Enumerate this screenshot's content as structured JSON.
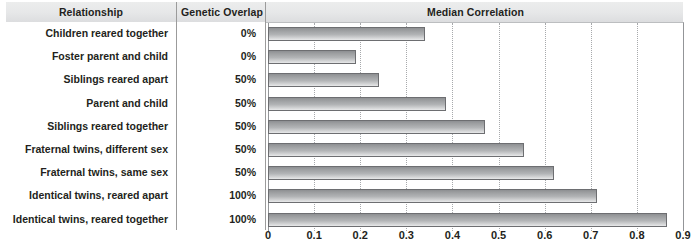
{
  "header": {
    "col_relationship": "Relationship",
    "col_genetic_overlap": "Genetic Overlap",
    "col_median_correlation": "Median Correlation"
  },
  "rows": [
    {
      "relationship": "Children reared together",
      "genetic_overlap": "0%",
      "median_correlation": 0.34
    },
    {
      "relationship": "Foster parent and child",
      "genetic_overlap": "0%",
      "median_correlation": 0.19
    },
    {
      "relationship": "Siblings reared apart",
      "genetic_overlap": "50%",
      "median_correlation": 0.24
    },
    {
      "relationship": "Parent and child",
      "genetic_overlap": "50%",
      "median_correlation": 0.385
    },
    {
      "relationship": "Siblings reared together",
      "genetic_overlap": "50%",
      "median_correlation": 0.47
    },
    {
      "relationship": "Fraternal twins, different sex",
      "genetic_overlap": "50%",
      "median_correlation": 0.555
    },
    {
      "relationship": "Fraternal twins, same sex",
      "genetic_overlap": "50%",
      "median_correlation": 0.62
    },
    {
      "relationship": "Identical twins, reared apart",
      "genetic_overlap": "100%",
      "median_correlation": 0.713
    },
    {
      "relationship": "Identical twins, reared together",
      "genetic_overlap": "100%",
      "median_correlation": 0.865
    }
  ],
  "axis": {
    "ticks": [
      "0",
      "0.1",
      "0.2",
      "0.3",
      "0.4",
      "0.5",
      "0.6",
      "0.7",
      "0.8",
      "0.9"
    ],
    "min": 0,
    "max": 0.9
  },
  "colors": {
    "bar_dark": "#8d8f92",
    "bar_light": "#e8e9ea",
    "bar_border": "#6d6e71",
    "header_band": "#e6e7e8",
    "text": "#231f20",
    "gridline": "#a7a9ac"
  },
  "chart_data": {
    "type": "bar",
    "title": "Median Correlation",
    "orientation": "horizontal",
    "xlabel": "",
    "ylabel": "",
    "xlim": [
      0,
      0.9
    ],
    "grid": true,
    "legend": null,
    "categories": [
      "Children reared together",
      "Foster parent and child",
      "Siblings reared apart",
      "Parent and child",
      "Siblings reared together",
      "Fraternal twins, different sex",
      "Fraternal twins, same sex",
      "Identical twins, reared apart",
      "Identical twins, reared together"
    ],
    "values": [
      0.34,
      0.19,
      0.24,
      0.385,
      0.47,
      0.555,
      0.62,
      0.713,
      0.865
    ],
    "genetic_overlap": [
      "0%",
      "0%",
      "50%",
      "50%",
      "50%",
      "50%",
      "50%",
      "100%",
      "100%"
    ],
    "xticks": [
      0,
      0.1,
      0.2,
      0.3,
      0.4,
      0.5,
      0.6,
      0.7,
      0.8,
      0.9
    ],
    "xticklabels": [
      "0",
      "0.1",
      "0.2",
      "0.3",
      "0.4",
      "0.5",
      "0.6",
      "0.7",
      "0.8",
      "0.9"
    ]
  }
}
